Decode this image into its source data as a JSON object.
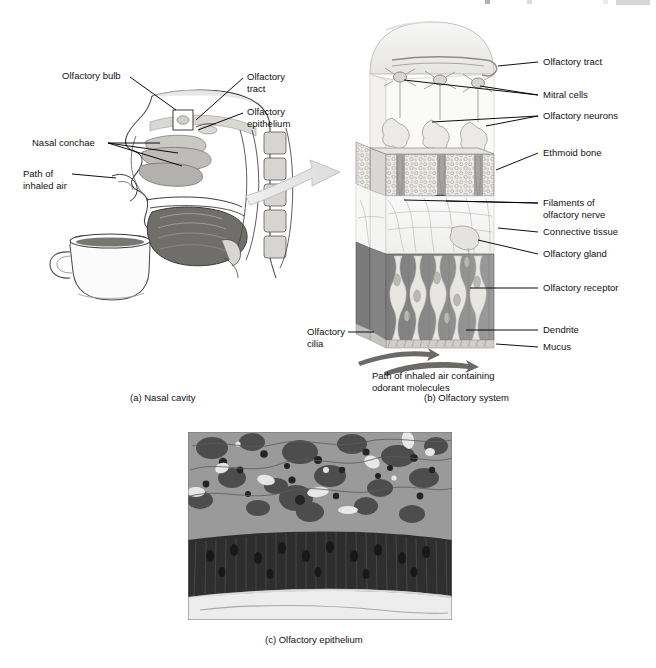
{
  "figure": {
    "panels": [
      {
        "id": "a",
        "caption": "(a) Nasal cavity"
      },
      {
        "id": "b",
        "caption": "(b) Olfactory system"
      },
      {
        "id": "c",
        "caption": "(c) Olfactory epithelium"
      }
    ]
  },
  "panel_a": {
    "caption": "(a) Nasal cavity",
    "labels": [
      {
        "key": "olfactory_bulb",
        "text": "Olfactory bulb"
      },
      {
        "key": "olfactory_tract",
        "text": "Olfactory\ntract"
      },
      {
        "key": "olfactory_epithelium",
        "text": "Olfactory\nepithelium"
      },
      {
        "key": "nasal_conchae",
        "text": "Nasal conchae"
      },
      {
        "key": "path_inhaled_air",
        "text": "Path of\ninhaled air"
      }
    ],
    "objects": [
      "sagittal-head-section",
      "coffee-cup",
      "transition-arrow"
    ]
  },
  "panel_b": {
    "caption": "(b) Olfactory system",
    "labels": [
      {
        "key": "olfactory_tract",
        "text": "Olfactory tract"
      },
      {
        "key": "mitral_cells",
        "text": "Mitral cells"
      },
      {
        "key": "olfactory_neurons",
        "text": "Olfactory neurons"
      },
      {
        "key": "ethmoid_bone",
        "text": "Ethmoid bone"
      },
      {
        "key": "filaments",
        "text": "Filaments of\nolfactory nerve"
      },
      {
        "key": "connective_tissue",
        "text": "Connective tissue"
      },
      {
        "key": "olfactory_gland",
        "text": "Olfactory gland"
      },
      {
        "key": "olfactory_receptor",
        "text": "Olfactory receptor"
      },
      {
        "key": "dendrite",
        "text": "Dendrite"
      },
      {
        "key": "mucus",
        "text": "Mucus"
      },
      {
        "key": "olfactory_cilia",
        "text": "Olfactory\ncilia"
      }
    ],
    "airflow_note": "Path of inhaled air containing\nodorant molecules"
  },
  "panel_c": {
    "caption": "(c) Olfactory epithelium",
    "image_type": "light-micrograph-grayscale"
  },
  "colors": {
    "ink": "#111111",
    "line": "#000000",
    "bone_fill": "#e8e7e4",
    "epithelium_fill": "#8d8d8d",
    "connective_fill": "#f2f2f1",
    "bulb_fill": "#efeeec",
    "arrow_fill": "#e4e4e6",
    "micrograph_dark": "#3a3a3a",
    "micrograph_light": "#f4f4f4",
    "page_bg": "#ffffff"
  }
}
